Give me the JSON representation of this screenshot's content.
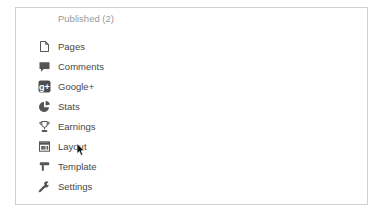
{
  "panel": {
    "published_label": "Published (2)"
  },
  "menu": {
    "items": [
      {
        "label": "Pages",
        "icon": "pages-icon"
      },
      {
        "label": "Comments",
        "icon": "comments-icon"
      },
      {
        "label": "Google+",
        "icon": "googleplus-icon"
      },
      {
        "label": "Stats",
        "icon": "stats-icon"
      },
      {
        "label": "Earnings",
        "icon": "earnings-icon"
      },
      {
        "label": "Layout",
        "icon": "layout-icon"
      },
      {
        "label": "Template",
        "icon": "template-icon"
      },
      {
        "label": "Settings",
        "icon": "settings-icon"
      }
    ]
  },
  "googleplus_glyph": "g+",
  "colors": {
    "panel_border": "#cfcfcf",
    "muted_text": "#999999",
    "menu_text": "#484848",
    "icon": "#555555",
    "background": "#ffffff"
  },
  "cursor": {
    "state": "default-arrow"
  }
}
